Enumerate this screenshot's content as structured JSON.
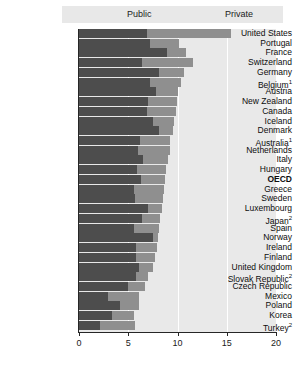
{
  "legend": {
    "entries": [
      {
        "label": "Public",
        "color": "#4d4d4d",
        "key": "public"
      },
      {
        "label": "Private",
        "color": "#8f8f8f",
        "key": "private"
      }
    ]
  },
  "axis": {
    "ticks": [
      "0",
      "5",
      "10",
      "15",
      "20"
    ],
    "min": 0,
    "max": 20
  },
  "chart_data": {
    "type": "bar",
    "orientation": "horizontal",
    "stacked": true,
    "title": "",
    "xlabel": "",
    "ylabel": "",
    "xlim": [
      0,
      20
    ],
    "xticks": [
      0,
      5,
      10,
      15,
      20
    ],
    "grid": true,
    "legend_position": "top",
    "series": [
      {
        "name": "Public",
        "color": "#4d4d4d",
        "values": [
          6.9,
          7.2,
          8.9,
          6.4,
          8.1,
          7.2,
          7.8,
          7.0,
          6.9,
          7.5,
          8.1,
          6.2,
          6.0,
          6.5,
          5.9,
          6.3,
          5.6,
          5.7,
          7.0,
          6.4,
          5.6,
          7.5,
          5.8,
          5.8,
          6.1,
          5.8,
          5.0,
          2.9,
          4.2,
          3.4,
          2.1
        ]
      },
      {
        "name": "Private",
        "color": "#8f8f8f",
        "values": [
          8.5,
          3.0,
          2.0,
          5.2,
          2.6,
          3.2,
          2.3,
          2.9,
          2.9,
          2.1,
          1.4,
          3.0,
          3.2,
          2.5,
          2.9,
          2.4,
          3.0,
          2.8,
          1.4,
          1.8,
          2.5,
          0.5,
          2.1,
          1.9,
          1.4,
          1.2,
          1.7,
          3.2,
          1.9,
          2.2,
          3.6
        ]
      }
    ],
    "categories": [
      "United States",
      "Portugal",
      "France",
      "Switzerland",
      "Germany",
      "Belgium",
      "Austria",
      "New Zealand",
      "Canada",
      "Iceland",
      "Denmark",
      "Australia",
      "Netherlands",
      "Italy",
      "Hungary",
      "OECD",
      "Greece",
      "Sweden",
      "Luxembourg",
      "Japan",
      "Spain",
      "Norway",
      "Ireland",
      "Finland",
      "United Kingdom",
      "Slovak Republic",
      "Czech Republic",
      "Mexico",
      "Poland",
      "Korea",
      "Turkey"
    ],
    "totals": [
      15.4,
      10.2,
      10.9,
      11.6,
      10.7,
      10.4,
      10.1,
      9.9,
      9.8,
      9.6,
      9.5,
      9.2,
      9.2,
      9.0,
      8.8,
      8.7,
      8.6,
      8.5,
      8.4,
      8.2,
      8.1,
      8.0,
      7.9,
      7.7,
      7.5,
      7.0,
      6.7,
      6.1,
      6.1,
      5.6,
      5.7
    ]
  },
  "rows": [
    {
      "label": "United States",
      "footnote": "",
      "public": 6.9,
      "private": 8.5,
      "bold": false
    },
    {
      "label": "Portugal",
      "footnote": "",
      "public": 7.2,
      "private": 3.0,
      "bold": false
    },
    {
      "label": "France",
      "footnote": "",
      "public": 8.9,
      "private": 2.0,
      "bold": false
    },
    {
      "label": "Switzerland",
      "footnote": "",
      "public": 6.4,
      "private": 5.2,
      "bold": false
    },
    {
      "label": "Germany",
      "footnote": "",
      "public": 8.1,
      "private": 2.6,
      "bold": false
    },
    {
      "label": "Belgium",
      "footnote": "1",
      "public": 7.2,
      "private": 3.2,
      "bold": false
    },
    {
      "label": "Austria",
      "footnote": "",
      "public": 7.8,
      "private": 2.3,
      "bold": false
    },
    {
      "label": "New Zealand",
      "footnote": "",
      "public": 7.0,
      "private": 2.9,
      "bold": false
    },
    {
      "label": "Canada",
      "footnote": "",
      "public": 6.9,
      "private": 2.9,
      "bold": false
    },
    {
      "label": "Iceland",
      "footnote": "",
      "public": 7.5,
      "private": 2.1,
      "bold": false
    },
    {
      "label": "Denmark",
      "footnote": "",
      "public": 8.1,
      "private": 1.4,
      "bold": false
    },
    {
      "label": "Australia",
      "footnote": "1",
      "public": 6.2,
      "private": 3.0,
      "bold": false
    },
    {
      "label": "Netherlands",
      "footnote": "",
      "public": 6.0,
      "private": 3.2,
      "bold": false
    },
    {
      "label": "Italy",
      "footnote": "",
      "public": 6.5,
      "private": 2.5,
      "bold": false
    },
    {
      "label": "Hungary",
      "footnote": "",
      "public": 5.9,
      "private": 2.9,
      "bold": false
    },
    {
      "label": "OECD",
      "footnote": "",
      "public": 6.3,
      "private": 2.4,
      "bold": true
    },
    {
      "label": "Greece",
      "footnote": "",
      "public": 5.6,
      "private": 3.0,
      "bold": false
    },
    {
      "label": "Sweden",
      "footnote": "",
      "public": 5.7,
      "private": 2.8,
      "bold": false
    },
    {
      "label": "Luxembourg",
      "footnote": "",
      "public": 7.0,
      "private": 1.4,
      "bold": false
    },
    {
      "label": "Japan",
      "footnote": "2",
      "public": 6.4,
      "private": 1.8,
      "bold": false
    },
    {
      "label": "Spain",
      "footnote": "",
      "public": 5.6,
      "private": 2.5,
      "bold": false
    },
    {
      "label": "Norway",
      "footnote": "",
      "public": 7.5,
      "private": 0.5,
      "bold": false
    },
    {
      "label": "Ireland",
      "footnote": "",
      "public": 5.8,
      "private": 2.1,
      "bold": false
    },
    {
      "label": "Finland",
      "footnote": "",
      "public": 5.8,
      "private": 1.9,
      "bold": false
    },
    {
      "label": "United Kingdom",
      "footnote": "",
      "public": 6.1,
      "private": 1.4,
      "bold": false
    },
    {
      "label": "Slovak Republic",
      "footnote": "2",
      "public": 5.8,
      "private": 1.2,
      "bold": false
    },
    {
      "label": "Czech Republic",
      "footnote": "",
      "public": 5.0,
      "private": 1.7,
      "bold": false
    },
    {
      "label": "Mexico",
      "footnote": "",
      "public": 2.9,
      "private": 3.2,
      "bold": false
    },
    {
      "label": "Poland",
      "footnote": "",
      "public": 4.2,
      "private": 1.9,
      "bold": false
    },
    {
      "label": "Korea",
      "footnote": "",
      "public": 3.4,
      "private": 2.2,
      "bold": false
    },
    {
      "label": "Turkey",
      "footnote": "2",
      "public": 2.1,
      "private": 3.6,
      "bold": false
    }
  ]
}
